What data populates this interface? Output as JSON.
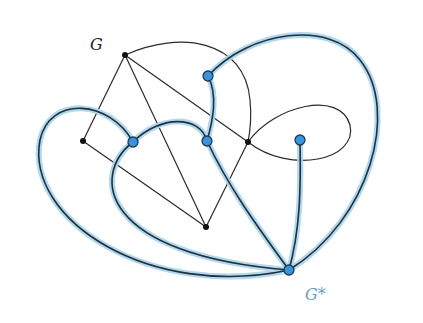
{
  "figure": {
    "width": 423,
    "height": 323,
    "colors": {
      "background": "#ffffff",
      "primal_edge": "#2a2a2a",
      "primal_vertex": "#111111",
      "dual_edge": "#1f2f3f",
      "dual_halo": "#a9d4ea",
      "dual_vertex_fill": "#3a93dd",
      "dual_vertex_stroke": "#1d3a55",
      "dual_label": "#6a9ec4"
    },
    "labels": {
      "primal": "G",
      "dual": "G*"
    },
    "primal_graph": {
      "vertices": [
        {
          "id": "a",
          "x": 125,
          "y": 55
        },
        {
          "id": "b",
          "x": 83,
          "y": 141
        },
        {
          "id": "c",
          "x": 206,
          "y": 227
        },
        {
          "id": "d",
          "x": 248,
          "y": 142
        }
      ],
      "edges": [
        {
          "from": "a",
          "to": "b",
          "shape": "straight"
        },
        {
          "from": "a",
          "to": "c",
          "shape": "straight"
        },
        {
          "from": "a",
          "to": "d",
          "shape": "straight"
        },
        {
          "from": "a",
          "to": "d",
          "shape": "arc"
        },
        {
          "from": "b",
          "to": "c",
          "shape": "straight"
        },
        {
          "from": "c",
          "to": "d",
          "shape": "straight"
        },
        {
          "from": "d",
          "to": "d",
          "shape": "loop"
        }
      ]
    },
    "dual_graph": {
      "vertices": [
        {
          "id": "f1",
          "x": 208,
          "y": 76
        },
        {
          "id": "f2",
          "x": 133,
          "y": 142
        },
        {
          "id": "f3",
          "x": 207,
          "y": 141
        },
        {
          "id": "f4",
          "x": 300,
          "y": 140
        },
        {
          "id": "f5",
          "x": 289,
          "y": 270
        }
      ],
      "edge_count": 7
    }
  }
}
